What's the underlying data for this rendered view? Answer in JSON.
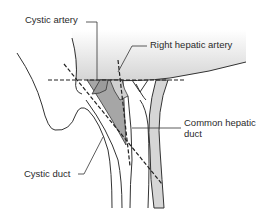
{
  "figure": {
    "labels": {
      "cystic_artery": "Cystic artery",
      "right_hepatic_artery": "Right hepatic artery",
      "common_hepatic_duct_line1": "Common hepatic",
      "common_hepatic_duct_line2": "duct",
      "cystic_duct": "Cystic duct"
    },
    "colors": {
      "line": "#333333",
      "triangle_fill": "#a6a6a6",
      "duct_fill": "#d6d6d6",
      "liver_gradient_top": "#ffffff",
      "liver_gradient_bottom": "#d9d9d9",
      "background": "#ffffff"
    }
  }
}
